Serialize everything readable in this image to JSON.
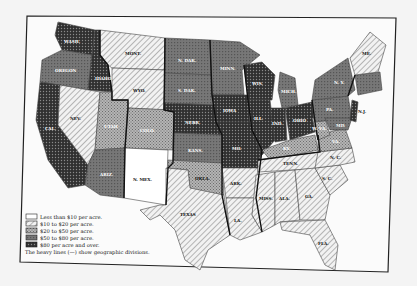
{
  "map": {
    "subject": "Value of farm land per acre by state",
    "legend": {
      "items": [
        {
          "key": "c1",
          "label": "Less than $10 per acre."
        },
        {
          "key": "c2",
          "label": "$10 to $20 per acre."
        },
        {
          "key": "c3",
          "label": "$20 to $50 per acre."
        },
        {
          "key": "c4",
          "label": "$50 to $80 per acre."
        },
        {
          "key": "c5",
          "label": "$80 per acre and over."
        }
      ],
      "note": "The heavy lines (—) show geographic divisions."
    },
    "fills": {
      "c1": "#ffffff",
      "c2": "#d8d8d8",
      "c3": "#9a9a9a",
      "c4": "#6a6a6a",
      "c5": "#3c3c3c"
    },
    "state_labels": {
      "wash": "WASH.",
      "oreg": "OREGON",
      "calif": "CAL.",
      "idaho": "IDAHO",
      "nev": "NEV.",
      "utah": "UTAH",
      "ariz": "ARIZ.",
      "mont": "MONT.",
      "wyo": "WYO.",
      "colo": "COLO.",
      "nmex": "N. MEX.",
      "ndak": "N. DAK.",
      "sdak": "S. DAK.",
      "nebr": "NEBR.",
      "kans": "KANS.",
      "okla": "OKLA.",
      "texas": "TEXAS",
      "minn": "MINN.",
      "iowa": "IOWA",
      "mo": "MO.",
      "ark": "ARK.",
      "la": "LA.",
      "wis": "WIS.",
      "ill": "ILL.",
      "mich": "MICH.",
      "ind": "IND.",
      "ohio": "OHIO",
      "ky": "KY.",
      "tenn": "TENN.",
      "miss": "MISS.",
      "ala": "ALA.",
      "ga": "GA.",
      "fla": "FLA.",
      "sc": "S. C.",
      "nc": "N. C.",
      "va": "VA.",
      "wva": "W. VA.",
      "pa": "PA.",
      "ny": "N. Y.",
      "md": "MD.",
      "nj": "N.J.",
      "me": "ME."
    }
  }
}
